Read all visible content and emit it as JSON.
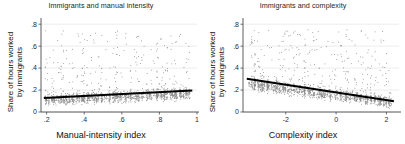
{
  "figure": {
    "background_color": "#ffffff",
    "point_color": "#8a8a8a",
    "fitline_color": "#000000",
    "axis_color": "#4a4a4a",
    "grid_color": "#d8d8d8"
  },
  "chart_data": [
    {
      "type": "scatter",
      "panel": "left",
      "title": "Immigrants and manual intensity",
      "xlabel": "Manual-intensity index",
      "ylabel": "Share of hours worked by immigrants",
      "ylabel_line1": "Share of hours worked",
      "ylabel_line2": "by immigrants",
      "xlim": [
        0.17,
        1.0
      ],
      "ylim": [
        0.0,
        0.82
      ],
      "xticks": [
        0.2,
        0.4,
        0.6,
        0.8,
        1
      ],
      "xtick_labels": [
        ".2",
        ".4",
        ".6",
        ".8",
        "1"
      ],
      "yticks": [
        0,
        0.2,
        0.4,
        0.6,
        0.8
      ],
      "ytick_labels": [
        "0",
        ".2",
        ".4",
        ".6",
        ".8"
      ],
      "grid": true,
      "legend": "none",
      "fit_line": {
        "x_start": 0.185,
        "y_start": 0.128,
        "x_end": 0.975,
        "y_end": 0.195,
        "slope": 0.0848,
        "intercept": 0.1123
      },
      "n_points": 1400,
      "seed": 20231,
      "cluster_count": 74,
      "x_cluster_min": 0.19,
      "x_cluster_max": 0.965,
      "y_base_mean": 0.115,
      "y_spread": 0.085,
      "y_tail_fraction": 0.22,
      "y_tail_max": 0.74
    },
    {
      "type": "scatter",
      "panel": "right",
      "title": "Immigrants and complexity",
      "xlabel": "Complexity index",
      "ylabel": "Share of hours worked by immigrants",
      "ylabel_line1": "Share of hours worked",
      "ylabel_line2": "by immigrants",
      "xlim": [
        -3.7,
        2.5
      ],
      "ylim": [
        0.0,
        0.82
      ],
      "xticks": [
        -2,
        0,
        2
      ],
      "xtick_labels": [
        "-2",
        "0",
        "2"
      ],
      "yticks": [
        0,
        0.2,
        0.4,
        0.6,
        0.8
      ],
      "ytick_labels": [
        "0",
        ".2",
        ".4",
        ".6",
        ".8"
      ],
      "grid": true,
      "legend": "none",
      "fit_line": {
        "x_start": -3.55,
        "y_start": 0.302,
        "x_end": 2.3,
        "y_end": 0.098,
        "slope": -0.0349,
        "intercept": 0.1783
      },
      "n_points": 1400,
      "seed": 77041,
      "cluster_count": 80,
      "x_cluster_min": -3.45,
      "x_cluster_max": 2.25,
      "y_base_mean": 0.135,
      "y_spread": 0.09,
      "y_tail_fraction": 0.24,
      "y_tail_max": 0.75
    }
  ]
}
